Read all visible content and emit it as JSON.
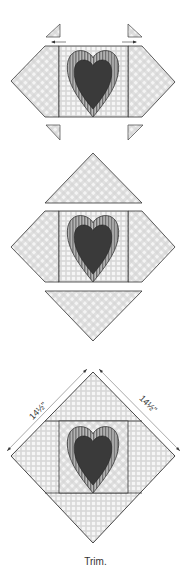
{
  "diagram": {
    "steps": [
      {
        "id": "step-1",
        "description": "Center heart block with side pieces and four small corner triangles"
      },
      {
        "id": "step-2",
        "description": "Add large setting triangles to top and bottom"
      },
      {
        "id": "step-3",
        "description": "Assembled on-point block with trim dimensions"
      }
    ],
    "dimensions": {
      "left": "14½\"",
      "right": "14½\""
    },
    "caption": "Trim.",
    "colors": {
      "heart_fill": "#3a3a3a",
      "heart_stripe": "#8a8a8a",
      "outline": "#333333",
      "fabric_check": "#c8c8c8",
      "background": "#ffffff"
    }
  }
}
